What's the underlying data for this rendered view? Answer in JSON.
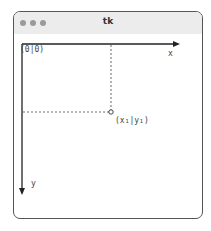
{
  "window": {
    "title": "tk",
    "buttons": [
      "close",
      "minimize",
      "maximize"
    ]
  },
  "diagram": {
    "origin_label": "(0|0)",
    "x_axis_label": "x",
    "y_axis_label": "y",
    "point_label": "(x₁|y₁)",
    "colors": {
      "axis": "#222222",
      "guide": "#444444",
      "frame": "#555555",
      "titlebar": "#ececec"
    }
  }
}
